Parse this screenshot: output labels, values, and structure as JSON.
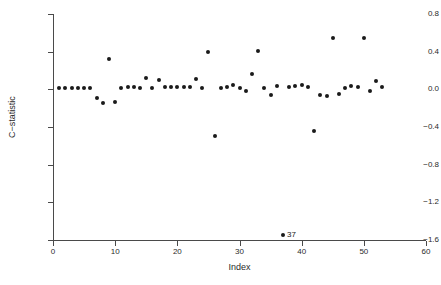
{
  "chart_data": {
    "type": "scatter",
    "title": "",
    "xlabel": "Index",
    "ylabel": "C−statistic",
    "xlim": [
      0,
      60
    ],
    "ylim": [
      -1.6,
      0.8
    ],
    "grid": false,
    "legend": null,
    "xticks": [
      0,
      10,
      20,
      30,
      40,
      50,
      60
    ],
    "xtick_labels": [
      "0",
      "10",
      "20",
      "30",
      "40",
      "50",
      "60"
    ],
    "yticks": [
      0.8,
      0.4,
      0.0,
      -0.4,
      -0.8,
      -1.2,
      -1.6
    ],
    "ytick_labels": [
      "0.8",
      "0.4",
      "0.0",
      "−0.4",
      "−0.8",
      "−1.2",
      "−1.6"
    ],
    "marker": "filled-circle",
    "marker_color": "#1a1a1a",
    "series": [
      {
        "name": "C-statistic",
        "x": [
          1,
          2,
          3,
          4,
          5,
          6,
          7,
          8,
          9,
          10,
          11,
          12,
          13,
          14,
          15,
          16,
          17,
          18,
          19,
          20,
          21,
          22,
          23,
          24,
          25,
          26,
          27,
          28,
          29,
          30,
          31,
          32,
          33,
          34,
          35,
          36,
          37,
          38,
          39,
          40,
          41,
          42,
          43,
          44,
          45,
          46,
          47,
          48,
          49,
          50,
          51,
          52,
          53
        ],
        "y": [
          0.01,
          0.01,
          0.01,
          0.01,
          0.01,
          0.01,
          -0.09,
          -0.15,
          0.32,
          -0.13,
          0.01,
          0.02,
          0.02,
          0.01,
          0.12,
          0.01,
          0.1,
          0.02,
          0.03,
          0.03,
          0.02,
          0.02,
          0.11,
          0.01,
          0.4,
          -0.5,
          0.01,
          0.03,
          0.05,
          0.01,
          -0.02,
          0.16,
          0.41,
          0.01,
          -0.06,
          0.04,
          -1.55,
          0.02,
          0.04,
          0.05,
          0.02,
          -0.44,
          -0.06,
          -0.07,
          0.55,
          -0.05,
          0.01,
          0.04,
          0.03,
          0.55,
          -0.02,
          0.09,
          0.02
        ]
      }
    ],
    "annotations": [
      {
        "text": "37",
        "x": 37,
        "y": -1.55
      }
    ]
  }
}
